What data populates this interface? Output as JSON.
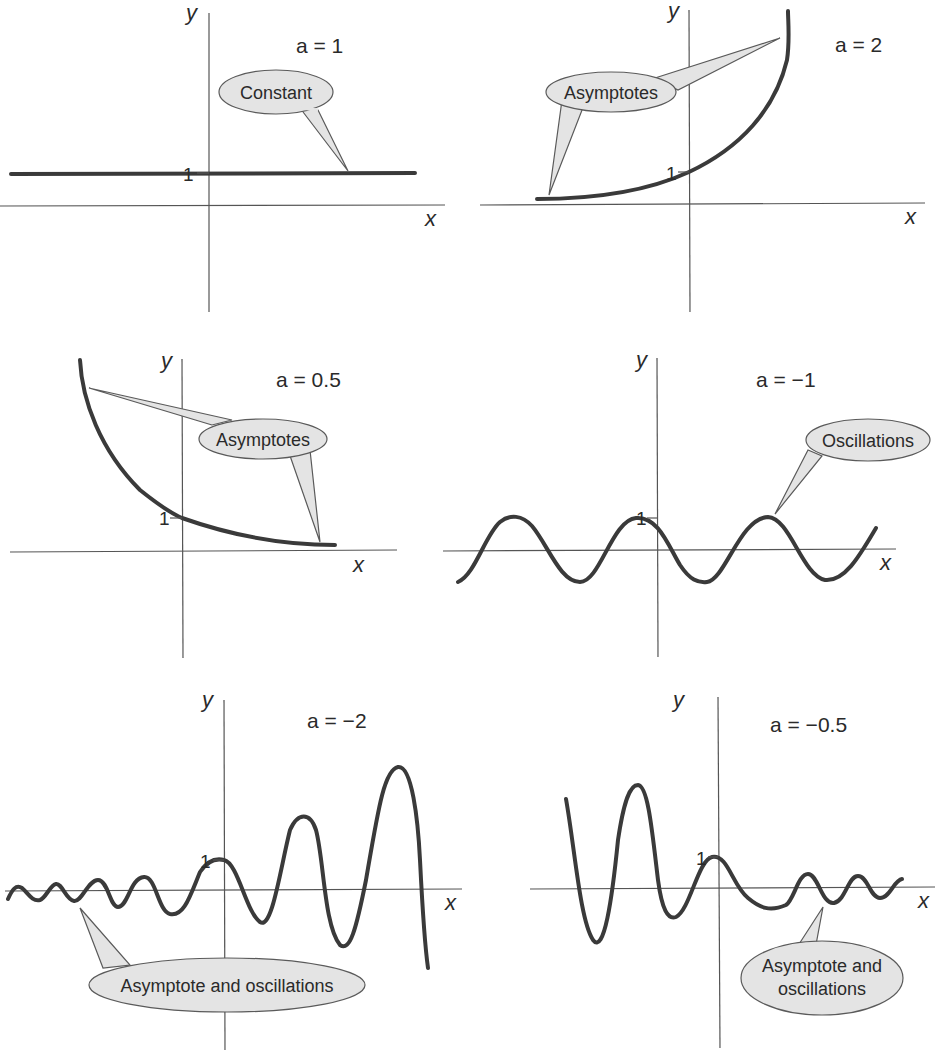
{
  "figure": {
    "panels": [
      {
        "id": "p1",
        "param": "a = 1",
        "x_label": "x",
        "y_label": "y",
        "tick_one": "1",
        "callout": [
          "Constant"
        ]
      },
      {
        "id": "p2",
        "param": "a = 2",
        "x_label": "x",
        "y_label": "y",
        "tick_one": "1",
        "callout": [
          "Asymptotes"
        ]
      },
      {
        "id": "p3",
        "param": "a = 0.5",
        "x_label": "x",
        "y_label": "y",
        "tick_one": "1",
        "callout": [
          "Asymptotes"
        ]
      },
      {
        "id": "p4",
        "param": "a = −1",
        "x_label": "x",
        "y_label": "y",
        "tick_one": "1",
        "callout": [
          "Oscillations"
        ]
      },
      {
        "id": "p5",
        "param": "a = −2",
        "x_label": "x",
        "y_label": "y",
        "tick_one": "1",
        "callout": [
          "Asymptote and oscillations"
        ]
      },
      {
        "id": "p6",
        "param": "a = −0.5",
        "x_label": "x",
        "y_label": "y",
        "tick_one": "1",
        "callout": [
          "Asymptote and",
          "oscillations"
        ]
      }
    ],
    "colors": {
      "curve": "#3a3a3a",
      "axis": "#555555",
      "bubble_fill": "#e4e4e4",
      "bubble_stroke": "#5a5a5a"
    }
  }
}
